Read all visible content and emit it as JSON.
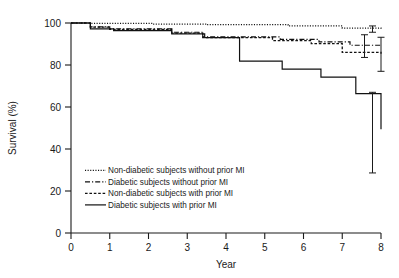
{
  "chart_data": {
    "type": "line",
    "title": "",
    "xlabel": "Year",
    "ylabel": "Survival (%)",
    "xlim": [
      0,
      8
    ],
    "ylim": [
      0,
      100
    ],
    "xticks": [
      0,
      1,
      2,
      3,
      4,
      5,
      6,
      7,
      8
    ],
    "yticks": [
      0,
      20,
      40,
      60,
      80,
      100
    ],
    "grid": false,
    "legend_position": "inside-lower-left",
    "series": [
      {
        "name": "Non-diabetic subjects without prior MI",
        "style": "dotted",
        "x": [
          0,
          0.45,
          2.1,
          3.5,
          5.6,
          7.0,
          8.0
        ],
        "y": [
          100,
          99.8,
          99.5,
          99.2,
          98.6,
          97.6,
          97.0
        ],
        "endpoint": 97.0,
        "error_low": 95.6,
        "error_high": 98.6
      },
      {
        "name": "Diabetic subjects without prior MI",
        "style": "dash-dot",
        "x": [
          0,
          0.5,
          1.0,
          2.0,
          2.6,
          3.4,
          4.4,
          5.4,
          6.4,
          7.2,
          8.0
        ],
        "y": [
          100,
          98.2,
          97.2,
          97.2,
          95.6,
          93.4,
          93.4,
          92.2,
          91.0,
          89.4,
          89.0
        ],
        "endpoint": 89.0,
        "error_low": 83.6,
        "error_high": 94.4
      },
      {
        "name": "Non-diabetic subjects with prior MI",
        "style": "short-dash",
        "x": [
          0,
          0.5,
          1.0,
          2.0,
          2.6,
          3.4,
          4.2,
          5.2,
          6.2,
          7.0,
          8.0
        ],
        "y": [
          100,
          98.0,
          97.0,
          97.0,
          95.2,
          93.0,
          93.0,
          91.6,
          90.2,
          86.0,
          85.4
        ],
        "endpoint": 85.4,
        "error_low": 77.0,
        "error_high": 93.2
      },
      {
        "name": "Diabetic subjects with prior MI",
        "style": "solid",
        "x": [
          0,
          0.5,
          1.1,
          2.05,
          2.6,
          3.45,
          4.35,
          5.45,
          6.45,
          7.35,
          8.0
        ],
        "y": [
          100,
          97.2,
          96.4,
          96.4,
          94.8,
          93.0,
          81.8,
          78.0,
          74.2,
          66.4,
          49.4
        ],
        "endpoint": 49.4,
        "error_low": 28.6,
        "error_high": 67.0
      }
    ]
  },
  "legend": {
    "entries": [
      {
        "label": "Non-diabetic subjects without prior MI",
        "style": "dotted"
      },
      {
        "label": "Diabetic subjects without prior MI",
        "style": "dash-dot"
      },
      {
        "label": "Non-diabetic subjects with prior MI",
        "style": "short-dash"
      },
      {
        "label": "Diabetic subjects with prior MI",
        "style": "solid"
      }
    ]
  },
  "axis": {
    "x_title": "Year",
    "y_title": "Survival (%)",
    "x_tick_labels": [
      "0",
      "1",
      "2",
      "3",
      "4",
      "5",
      "6",
      "7",
      "8"
    ],
    "y_tick_labels": [
      "0",
      "20",
      "40",
      "60",
      "80",
      "100"
    ]
  }
}
